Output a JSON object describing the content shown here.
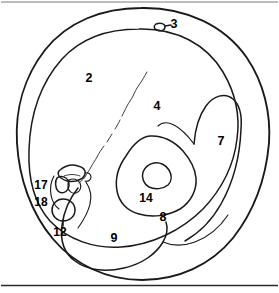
{
  "figure": {
    "type": "anatomical-line-drawing",
    "background_color": "#ffffff",
    "ink_color": "#1a1a1a",
    "canvas": {
      "width": 279,
      "height": 293
    },
    "frame": {
      "top_border_visible": true,
      "bottom_border_visible": true,
      "bottom_border_y": 285
    },
    "labels": [
      {
        "id": "label-3",
        "text": "3",
        "x": 172,
        "y": 25,
        "has_marker": true,
        "marker": "small-oval-with-leader"
      },
      {
        "id": "label-2",
        "text": "2",
        "x": 89,
        "y": 79,
        "has_marker": false,
        "marker": ""
      },
      {
        "id": "label-4",
        "text": "4",
        "x": 157,
        "y": 107,
        "has_marker": false,
        "marker": ""
      },
      {
        "id": "label-7",
        "text": "7",
        "x": 221,
        "y": 142,
        "has_marker": false,
        "marker": ""
      },
      {
        "id": "label-17",
        "text": "17",
        "x": 41,
        "y": 186,
        "has_marker": false,
        "marker": ""
      },
      {
        "id": "label-18",
        "text": "18",
        "x": 41,
        "y": 203,
        "has_marker": false,
        "marker": ""
      },
      {
        "id": "label-14",
        "text": "14",
        "x": 146,
        "y": 199,
        "has_marker": false,
        "marker": ""
      },
      {
        "id": "label-8",
        "text": "8",
        "x": 163,
        "y": 218,
        "has_marker": false,
        "marker": ""
      },
      {
        "id": "label-12",
        "text": "12",
        "x": 60,
        "y": 231,
        "has_marker": true,
        "marker": "small-circle-with-leader"
      },
      {
        "id": "label-9",
        "text": "9",
        "x": 114,
        "y": 239,
        "has_marker": false,
        "marker": ""
      }
    ],
    "regions": [
      {
        "number": "2",
        "name": "upper-left-region"
      },
      {
        "number": "3",
        "name": "top-marker-structure"
      },
      {
        "number": "4",
        "name": "upper-right-region"
      },
      {
        "number": "7",
        "name": "right-lateral-band"
      },
      {
        "number": "8",
        "name": "central-blob-outer"
      },
      {
        "number": "9",
        "name": "lower-region"
      },
      {
        "number": "12",
        "name": "small-circular-body"
      },
      {
        "number": "14",
        "name": "central-blob-inner"
      },
      {
        "number": "17",
        "name": "left-cluster-upper"
      },
      {
        "number": "18",
        "name": "left-cluster-lower"
      }
    ]
  }
}
